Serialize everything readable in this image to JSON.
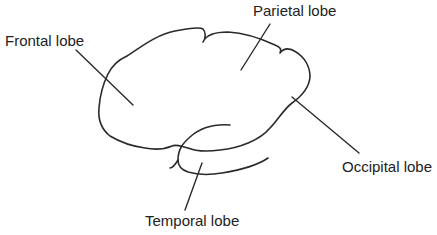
{
  "diagram": {
    "colors": {
      "line": "#2a2a2a",
      "text": "#222222",
      "background": "#ffffff"
    },
    "labels": {
      "frontal": "Frontal lobe",
      "parietal": "Parietal lobe",
      "occipital": "Occipital lobe",
      "temporal": "Temporal lobe"
    }
  }
}
